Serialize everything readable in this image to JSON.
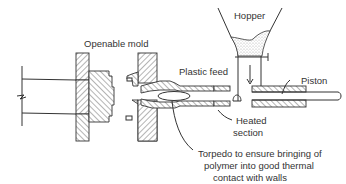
{
  "diagram": {
    "labels": {
      "openable_mold": "Openable mold",
      "hopper": "Hopper",
      "plastic_feed": "Plastic feed",
      "piston": "Piston",
      "heated_section_line1": "Heated",
      "heated_section_line2": "section",
      "torpedo_line1": "Torpedo to ensure bringing of",
      "torpedo_line2": "polymer into good thermal",
      "torpedo_line3": "contact with walls"
    },
    "colors": {
      "ink": "#333333",
      "granules": "#9a9a9a",
      "background": "#ffffff"
    }
  }
}
